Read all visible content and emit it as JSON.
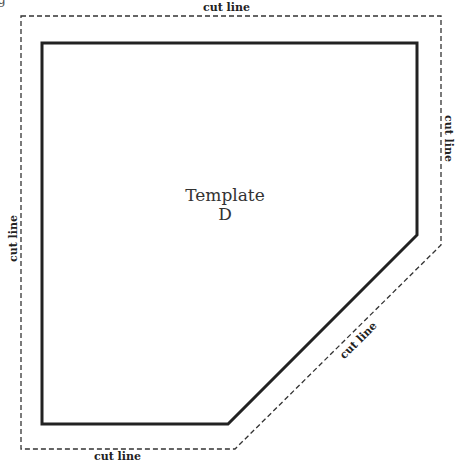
{
  "template": {
    "title_line1": "Template",
    "title_line2": "D"
  },
  "labels": {
    "top": "cut line",
    "bottom": "cut line",
    "left": "cut line",
    "right": "cut line",
    "diagonal": "cut line"
  },
  "fragment": "g",
  "colors": {
    "solid_outline": "#222222",
    "cut_line": "#333333",
    "background": "#ffffff"
  }
}
